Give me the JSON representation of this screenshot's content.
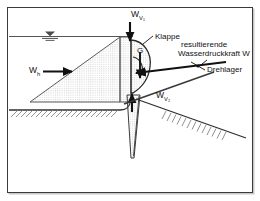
{
  "figure": {
    "kind": "engineering-cross-section-diagram",
    "language": "German",
    "background_color": "#ffffff",
    "frame_color": "#3a3a3a",
    "ink_color": "#111111",
    "hatch_color": "#9a9a9a"
  },
  "labels": {
    "w_v1": "W",
    "w_v1_sub": "V₁",
    "w_v2": "W",
    "w_v2_sub": "V₂",
    "w_h": "W",
    "w_h_sub": "h",
    "weight": "G",
    "klappe": "Klappe",
    "resultant_line1": "resultierende",
    "resultant_line2": "Wasserdruckkraft W",
    "drehlager": "Drehlager"
  },
  "elements": {
    "water_surface_symbol": "water-level-triangle",
    "pressure_triangle": "hydrostatic-pressure-distribution",
    "ground_hatch_horizontal": "horizontal-ground-hatching",
    "ground_hatch_sloped": "sloped-ground-hatching",
    "gate_body": "curved-flap-gate",
    "pier_wall": "vertical-pier-wall",
    "pivot_marker": "drehlager-pivot-point"
  }
}
